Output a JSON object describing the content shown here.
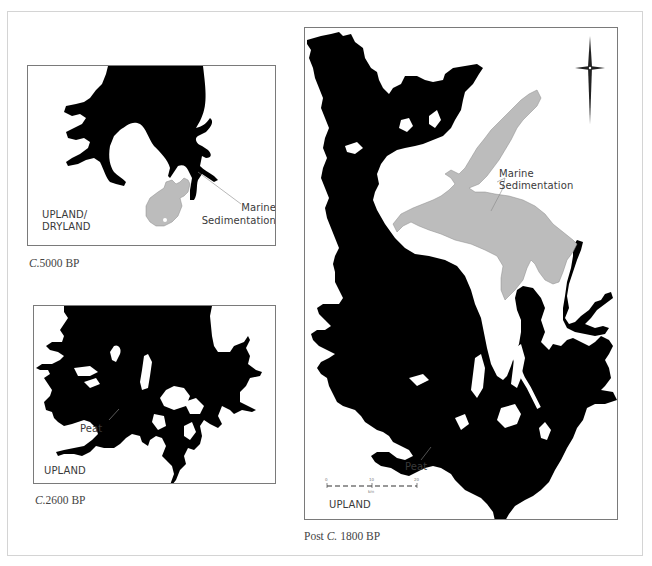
{
  "figure": {
    "panels": [
      {
        "id": "panel-5000bp",
        "caption_prefix": "C.",
        "caption_value": "5000 BP",
        "labels": {
          "marine_line1": "Marine",
          "marine_line2": "Sedimentation",
          "upland_line1": "UPLAND/",
          "upland_line2": "DRYLAND"
        }
      },
      {
        "id": "panel-2600bp",
        "caption_prefix": "C.",
        "caption_value": "2600 BP",
        "labels": {
          "peat": "Peat",
          "upland": "UPLAND"
        }
      },
      {
        "id": "panel-post1800bp",
        "caption_pre": "Post ",
        "caption_prefix": "C.",
        "caption_value": " 1800 BP",
        "labels": {
          "marine_line1": "Marine",
          "marine_line2": "Sedimentation",
          "peat": "Peat",
          "upland": "UPLAND"
        },
        "scale_bar": {
          "ticks": [
            "0",
            "10",
            "20"
          ],
          "unit": "km"
        },
        "north_arrow": "compass-star"
      }
    ],
    "colors": {
      "water_black": "#000000",
      "sediment_gray": "#bcbcbc",
      "frame": "#7a7a7a",
      "outer_frame": "#d4d4d4"
    }
  }
}
